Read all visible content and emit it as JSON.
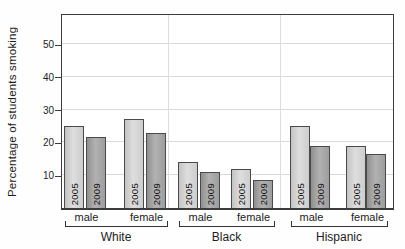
{
  "chart_data": {
    "type": "bar",
    "title": "",
    "xlabel": "",
    "ylabel": "Percentage of students smoking",
    "ylim": [
      0,
      59
    ],
    "yticks": [
      10,
      20,
      30,
      40,
      50
    ],
    "grid": true,
    "legend_position": "none (years labeled inside bars)",
    "group_labels": [
      "White",
      "Black",
      "Hispanic"
    ],
    "sex_labels": [
      "male",
      "female"
    ],
    "year_labels": [
      "2005",
      "2009"
    ],
    "bars": [
      {
        "group": "White",
        "sex": "male",
        "year": "2005",
        "value": 25
      },
      {
        "group": "White",
        "sex": "male",
        "year": "2009",
        "value": 21.5
      },
      {
        "group": "White",
        "sex": "female",
        "year": "2005",
        "value": 27
      },
      {
        "group": "White",
        "sex": "female",
        "year": "2009",
        "value": 23
      },
      {
        "group": "Black",
        "sex": "male",
        "year": "2005",
        "value": 14
      },
      {
        "group": "Black",
        "sex": "male",
        "year": "2009",
        "value": 11
      },
      {
        "group": "Black",
        "sex": "female",
        "year": "2005",
        "value": 12
      },
      {
        "group": "Black",
        "sex": "female",
        "year": "2009",
        "value": 8.5
      },
      {
        "group": "Hispanic",
        "sex": "male",
        "year": "2005",
        "value": 25
      },
      {
        "group": "Hispanic",
        "sex": "male",
        "year": "2009",
        "value": 19
      },
      {
        "group": "Hispanic",
        "sex": "female",
        "year": "2005",
        "value": 19
      },
      {
        "group": "Hispanic",
        "sex": "female",
        "year": "2009",
        "value": 16.5
      }
    ],
    "colors": {
      "bar_2005": "#d6d6d6",
      "bar_2009": "#a2a2a2",
      "bar_border": "#4a4a4a",
      "plot_border": "#3c3c3c",
      "gridline": "#d9d9d9",
      "text": "#1c1c1c",
      "plot_background": "#ffffff"
    }
  }
}
